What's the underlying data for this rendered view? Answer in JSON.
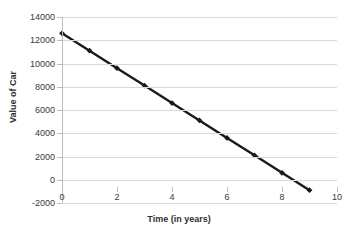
{
  "chart_data": {
    "type": "line",
    "title": "",
    "xlabel": "Time (in years)",
    "ylabel": "Value of Car",
    "x": [
      0,
      1,
      2,
      3,
      4,
      5,
      6,
      7,
      8,
      9
    ],
    "values": [
      12600,
      11100,
      9600,
      8100,
      6600,
      5100,
      3600,
      2100,
      600,
      -900
    ],
    "series": [
      {
        "name": "Value of Car",
        "values": [
          12600,
          11100,
          9600,
          8100,
          6600,
          5100,
          3600,
          2100,
          600,
          -900
        ]
      }
    ],
    "xlim": [
      0,
      10
    ],
    "ylim": [
      -2000,
      14000
    ],
    "x_ticks": [
      "0",
      "2",
      "4",
      "6",
      "8",
      "10"
    ],
    "x_tick_values": [
      0,
      2,
      4,
      6,
      8,
      10
    ],
    "y_ticks": [
      "-2000",
      "0",
      "2000",
      "4000",
      "6000",
      "8000",
      "10000",
      "12000",
      "14000"
    ],
    "y_tick_values": [
      -2000,
      0,
      2000,
      4000,
      6000,
      8000,
      10000,
      12000,
      14000
    ],
    "grid": true,
    "legend": false,
    "legend_position": "none",
    "line_color": "#1a1a1a",
    "marker": "diamond",
    "marker_color": "#1a1a1a",
    "gridline_color": "#d9d9d9",
    "axis_color": "#bfbfbf",
    "background_color": "#ffffff",
    "text_color": "#3a3a3a"
  }
}
